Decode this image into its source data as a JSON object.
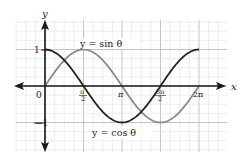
{
  "chart_data": {
    "type": "line",
    "title": "",
    "xlabel": "x",
    "ylabel": "y",
    "xlim": [
      -0.7854,
      6.5
    ],
    "ylim": [
      -1.6,
      1.7
    ],
    "grid": true,
    "x_ticks": [
      {
        "value": 0,
        "label": "0"
      },
      {
        "value": 1.5708,
        "label": "π/2"
      },
      {
        "value": 3.1416,
        "label": "π"
      },
      {
        "value": 4.7124,
        "label": "3π/2"
      },
      {
        "value": 6.2832,
        "label": "2π"
      }
    ],
    "y_ticks": [
      {
        "value": 1,
        "label": "1"
      },
      {
        "value": -1,
        "label": "−1"
      }
    ],
    "series": [
      {
        "name": "y = sin θ",
        "color": "#8a8a8a",
        "function": "sin",
        "domain": [
          0,
          6.2832
        ]
      },
      {
        "name": "y = cos θ",
        "color": "#222222",
        "function": "cos",
        "domain": [
          0,
          6.2832
        ]
      }
    ],
    "annotations": [
      {
        "text": "y = sin θ",
        "near": "sin peak"
      },
      {
        "text": "y = cos θ",
        "near": "cos trough"
      }
    ]
  },
  "labels": {
    "x_axis": "x",
    "y_axis": "y",
    "origin": "0",
    "y_one": "1",
    "y_neg_one": "−1",
    "tick_pi_half_num": "π",
    "tick_pi_half_den": "2",
    "tick_pi": "π",
    "tick_3pi_half_num": "3π",
    "tick_3pi_half_den": "2",
    "tick_2pi": "2π",
    "sin_label": "y = sin θ",
    "cos_label": "y = cos θ"
  }
}
